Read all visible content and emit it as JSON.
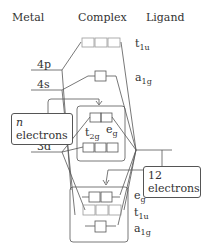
{
  "headers": {
    "metal": "Metal",
    "complex": "Complex",
    "ligand": "Ligand"
  },
  "metal_orbitals": [
    "4p",
    "4s",
    "3d"
  ],
  "complex_orbitals": {
    "top": [
      {
        "name": "t",
        "sub": "1u"
      },
      {
        "name": "a",
        "sub": "1g"
      }
    ],
    "middle": [
      {
        "name": "e",
        "sub": "g"
      },
      {
        "name": "t",
        "sub": "2g"
      }
    ],
    "bottom": [
      {
        "name": "e",
        "sub": "g"
      },
      {
        "name": "t",
        "sub": "1u"
      },
      {
        "name": "a",
        "sub": "1g"
      }
    ]
  },
  "callouts": {
    "metal_electrons": {
      "line1": "n",
      "line2": "electrons"
    },
    "ligand_electrons": {
      "line1": "12",
      "line2": "electrons"
    }
  }
}
